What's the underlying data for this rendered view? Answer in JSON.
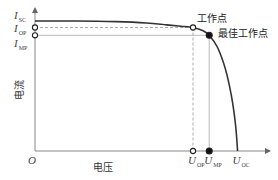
{
  "chart_data": {
    "type": "line",
    "title": "",
    "xlabel": "电压",
    "ylabel": "电流",
    "origin_label": "O",
    "x_ticks": [
      {
        "key": "uop",
        "main": "U",
        "sub": "OP",
        "value": 0.78
      },
      {
        "key": "ump",
        "main": "U",
        "sub": "MP",
        "value": 0.86
      },
      {
        "key": "uoc",
        "main": "U",
        "sub": "OC",
        "value": 1.0
      }
    ],
    "y_ticks": [
      {
        "key": "isc",
        "main": "I",
        "sub": "SC",
        "value": 1.0
      },
      {
        "key": "iop",
        "main": "I",
        "sub": "OP",
        "value": 0.95
      },
      {
        "key": "imp",
        "main": "I",
        "sub": "MP",
        "value": 0.89
      }
    ],
    "xlim": [
      0,
      1.16
    ],
    "ylim": [
      0,
      1.1
    ],
    "series": [
      {
        "name": "I-V curve",
        "x": [
          0,
          0.2,
          0.4,
          0.55,
          0.65,
          0.72,
          0.78,
          0.83,
          0.86,
          0.9,
          0.94,
          0.97,
          0.99,
          1.0
        ],
        "y": [
          1.0,
          1.0,
          0.995,
          0.985,
          0.97,
          0.96,
          0.95,
          0.925,
          0.89,
          0.8,
          0.63,
          0.42,
          0.2,
          0.0
        ]
      }
    ],
    "points": [
      {
        "key": "op",
        "label": "工作点",
        "x": 0.78,
        "y": 0.95,
        "style": "open"
      },
      {
        "key": "mp",
        "label": "最佳工作点",
        "x": 0.86,
        "y": 0.89,
        "style": "filled"
      }
    ],
    "annotations": {
      "operating_point": "工作点",
      "max_power_point": "最佳工作点"
    },
    "grid": false,
    "legend": "none"
  }
}
